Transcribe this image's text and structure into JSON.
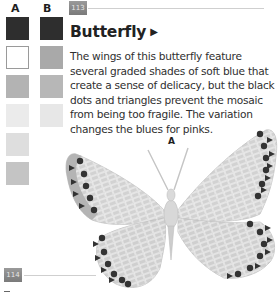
{
  "swatches": {
    "column_a": {
      "label": "A",
      "colors": [
        "#2e2e2e",
        "#ffffff",
        "#b3b3b3",
        "#ebebeb",
        "#dedede",
        "#c4c4c4"
      ]
    },
    "column_b": {
      "label": "B",
      "colors": [
        "#2e2e2e",
        "#a9a9a9",
        "#b7b7b7",
        "#e7e7e7"
      ]
    }
  },
  "page_numbers": {
    "top": "113",
    "bottom": "114"
  },
  "entry": {
    "title": "Butterfly",
    "title_marker": "▶",
    "body": "The wings of this butterfly feature several graded shades of soft blue that create a sense of delicacy, but the black dots and triangles prevent the mosaic from being too fragile. The variation changes the blues for pinks."
  },
  "figure": {
    "label": "A"
  }
}
